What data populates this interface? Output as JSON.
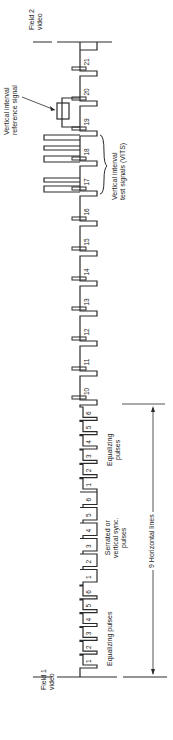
{
  "diagram": {
    "orientation": "rotated 90° counter-clockwise",
    "labels": {
      "field1": [
        "Field 1",
        "video"
      ],
      "field2": [
        "Field 2",
        "video"
      ],
      "equalizing_1": "Equalizing pulses",
      "serrated": [
        "Serrated or",
        "vertical sync.",
        "pulses"
      ],
      "equalizing_2": [
        "Equalizing",
        "pulses"
      ],
      "vits": [
        "Vertical interval",
        "test signals (VITS)"
      ],
      "vir": [
        "Vertical interval",
        "reference signal"
      ],
      "horizontal_lines": "9 Horizontal lines"
    },
    "pulse_numbers": {
      "equalizing_1": [
        "1",
        "2",
        "3",
        "4",
        "5",
        "6"
      ],
      "serrated": [
        "1",
        "2",
        "3",
        "4",
        "5",
        "6"
      ],
      "equalizing_2": [
        "1",
        "2",
        "3",
        "4",
        "5",
        "6"
      ],
      "lines": [
        "10",
        "11",
        "12",
        "13",
        "14",
        "15",
        "16",
        "17",
        "18",
        "19",
        "20",
        "21"
      ]
    },
    "colors": {
      "line": "#2a2a2a",
      "text": "#222222",
      "background": "#ffffff"
    }
  }
}
